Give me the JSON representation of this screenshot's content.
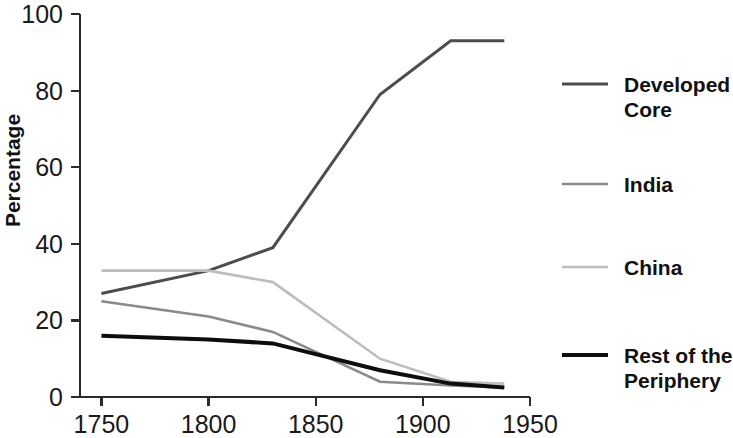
{
  "chart_data": {
    "type": "line",
    "title": "",
    "xlabel": "",
    "ylabel": "Percentage",
    "xlim": [
      1740,
      1950
    ],
    "ylim": [
      0,
      100
    ],
    "grid": false,
    "legend_position": "right",
    "x_ticks": [
      "1750",
      "1800",
      "1850",
      "1900",
      "1950"
    ],
    "x_tick_values": [
      1750,
      1800,
      1850,
      1900,
      1950
    ],
    "y_ticks": [
      "0",
      "20",
      "40",
      "60",
      "80",
      "100"
    ],
    "y_tick_values": [
      0,
      20,
      40,
      60,
      80,
      100
    ],
    "x": [
      1750,
      1800,
      1830,
      1880,
      1913,
      1938
    ],
    "series": [
      {
        "name": "Developed Core",
        "label_line1": "Developed",
        "label_line2": "Core",
        "color": "#4d4d4d",
        "width": 3.0,
        "values": [
          27,
          33,
          39,
          79,
          93,
          93
        ]
      },
      {
        "name": "India",
        "label_line1": "India",
        "label_line2": "",
        "color": "#8a8a8a",
        "width": 2.6,
        "values": [
          25,
          21,
          17,
          4,
          3,
          2.5
        ]
      },
      {
        "name": "China",
        "label_line1": "China",
        "label_line2": "",
        "color": "#bdbdbd",
        "width": 2.6,
        "values": [
          33,
          33,
          30,
          10,
          4,
          3.5
        ]
      },
      {
        "name": "Rest of the Periphery",
        "label_line1": "Rest of the",
        "label_line2": "Periphery",
        "color": "#0d0d0d",
        "width": 4.0,
        "values": [
          16,
          15,
          14,
          7,
          3.5,
          2.5
        ]
      }
    ]
  },
  "plot_geometry": {
    "left": 80,
    "right": 530,
    "top": 14,
    "bottom": 397
  },
  "legend_geometry": {
    "swatch_x1": 562,
    "swatch_x2": 608,
    "text_x": 624,
    "rows_y": [
      84,
      184,
      267,
      355
    ]
  }
}
